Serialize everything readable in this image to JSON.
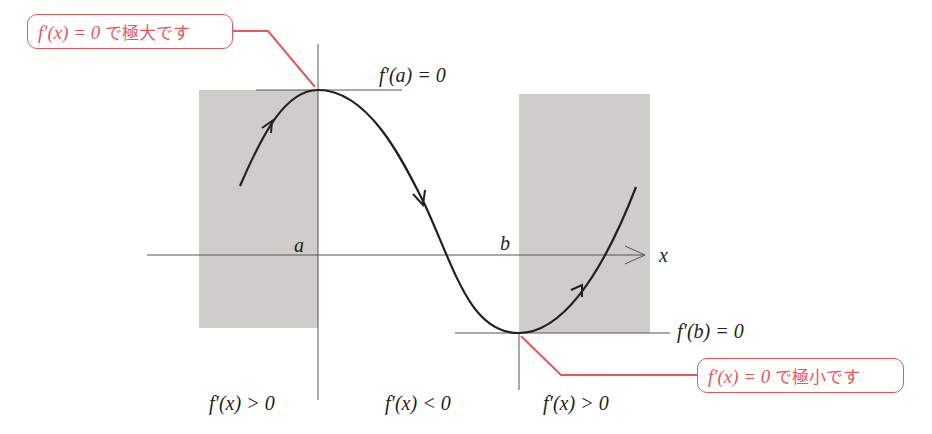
{
  "diagram": {
    "type": "function-graph-extrema",
    "callouts": {
      "maximum": {
        "expr": "f′(x) = 0",
        "text": "で極大です"
      },
      "minimum": {
        "expr": "f′(x) = 0",
        "text": "で極小です"
      }
    },
    "tangent_labels": {
      "at_a": "f′(a) = 0",
      "at_b": "f′(b) = 0"
    },
    "axis": {
      "x_label": "x",
      "point_a": "a",
      "point_b": "b"
    },
    "region_labels": [
      "f′(x) > 0",
      "f′(x) < 0",
      "f′(x) > 0"
    ],
    "colors": {
      "accent": "#e8565a",
      "shade": "#cfcdca",
      "ink": "#231f20",
      "axis": "#555555"
    }
  }
}
